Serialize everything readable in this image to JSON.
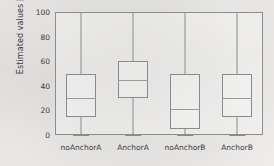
{
  "chart_data": {
    "type": "box",
    "title": "",
    "xlabel": "",
    "ylabel": "Estimated values [%]",
    "ylim": [
      0,
      100
    ],
    "yticks": [
      0,
      20,
      40,
      60,
      80,
      100
    ],
    "grid": false,
    "legend": "none",
    "categories": [
      "noAnchorA",
      "AnchorA",
      "noAnchorB",
      "AnchorB"
    ],
    "boxes": [
      {
        "name": "noAnchorA",
        "whisker_low": 0,
        "q1": 15,
        "median": 30,
        "q3": 50,
        "whisker_high": 100
      },
      {
        "name": "AnchorA",
        "whisker_low": 0,
        "q1": 30,
        "median": 45,
        "q3": 60,
        "whisker_high": 100
      },
      {
        "name": "noAnchorB",
        "whisker_low": 0,
        "q1": 5,
        "median": 21,
        "q3": 50,
        "whisker_high": 100
      },
      {
        "name": "AnchorB",
        "whisker_low": 0,
        "q1": 15,
        "median": 30,
        "q3": 50,
        "whisker_high": 100
      }
    ]
  },
  "style": {
    "line_color": "#8a8a8a",
    "median_color": "#9a9a9a",
    "text_color": "#3b3b3b",
    "background": "#f3f2f0"
  }
}
